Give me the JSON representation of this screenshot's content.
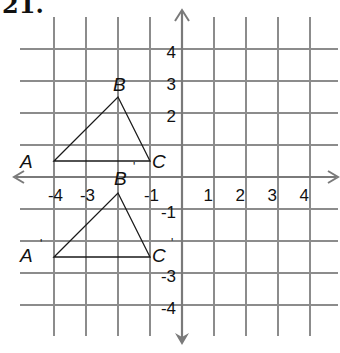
{
  "problem": {
    "number": "21."
  },
  "graph": {
    "origin_px": [
      182,
      177
    ],
    "unit_px": 32,
    "grid_range": {
      "xmin": -4,
      "xmax": 4,
      "ymin": -4,
      "ymax": 4
    },
    "colors": {
      "grid": "#8c8c8c",
      "axis": "#7a7a7a",
      "figure": "#1a1a1a",
      "text": "#111111"
    },
    "x_tick_labels": [
      {
        "value": -4,
        "label": "-4"
      },
      {
        "value": -3,
        "label": "-3"
      },
      {
        "value": -1,
        "label": "-1"
      },
      {
        "value": 1,
        "label": "1"
      },
      {
        "value": 2,
        "label": "2"
      },
      {
        "value": 3,
        "label": "3"
      },
      {
        "value": 4,
        "label": "4"
      }
    ],
    "y_tick_labels": [
      {
        "value": 4,
        "label": "4"
      },
      {
        "value": 3,
        "label": "3"
      },
      {
        "value": 2,
        "label": "2"
      },
      {
        "value": -1,
        "label": "-1"
      },
      {
        "value": -3,
        "label": "-3"
      },
      {
        "value": -4,
        "label": "-4"
      }
    ]
  },
  "figures": {
    "original": {
      "name": "Triangle ABC",
      "vertices": [
        {
          "label": "A",
          "prime": "",
          "x": -4,
          "y": 0.5
        },
        {
          "label": "B",
          "prime": "",
          "x": -2,
          "y": 2.5
        },
        {
          "label": "C",
          "prime": "",
          "x": -1,
          "y": 0.5
        }
      ]
    },
    "image": {
      "name": "Triangle A'B'C'",
      "vertices": [
        {
          "label": "A",
          "prime": "'",
          "x": -4,
          "y": -2.5
        },
        {
          "label": "B",
          "prime": "'",
          "x": -2,
          "y": -0.5
        },
        {
          "label": "C",
          "prime": "'",
          "x": -1,
          "y": -2.5
        }
      ]
    }
  },
  "labels": {
    "A": "A",
    "B": "B",
    "C": "C",
    "A_prime": "A",
    "B_prime": "B",
    "C_prime": "C",
    "prime_mark": "'"
  }
}
